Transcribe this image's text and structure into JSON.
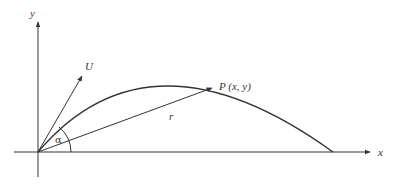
{
  "diagram": {
    "labels": {
      "y_axis": "y",
      "x_axis": "x",
      "velocity": "U",
      "point": "P (x, y)",
      "radius": "r",
      "angle": "α"
    },
    "colors": {
      "line": "#333333",
      "background": "#ffffff"
    }
  }
}
